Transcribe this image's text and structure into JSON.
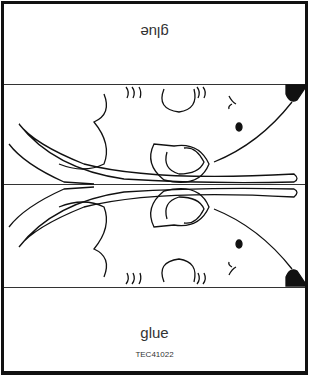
{
  "worksheet": {
    "top_label": "glue",
    "bottom_label": "glue",
    "code": "TEC41022"
  },
  "illustration": {
    "subject": "mouse",
    "layout": "mirrored fold",
    "line_color": "#111111"
  }
}
